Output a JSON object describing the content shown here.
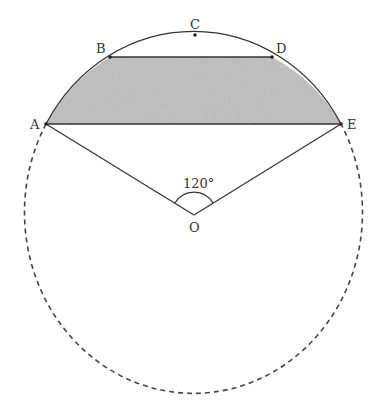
{
  "diagram": {
    "points": {
      "A": {
        "label": "A",
        "x": 46,
        "y": 124
      },
      "B": {
        "label": "B",
        "x": 110,
        "y": 57
      },
      "C": {
        "label": "C",
        "x": 195,
        "y": 35
      },
      "D": {
        "label": "D",
        "x": 272,
        "y": 57
      },
      "E": {
        "label": "E",
        "x": 341,
        "y": 124
      },
      "O": {
        "label": "O",
        "x": 194,
        "y": 215
      }
    },
    "angle_label": "120°",
    "shaded_region": "Region between chord BD, chord AE and arcs AB, DE",
    "colors": {
      "stroke": "#333333",
      "shade": "#c8c8c8"
    }
  }
}
